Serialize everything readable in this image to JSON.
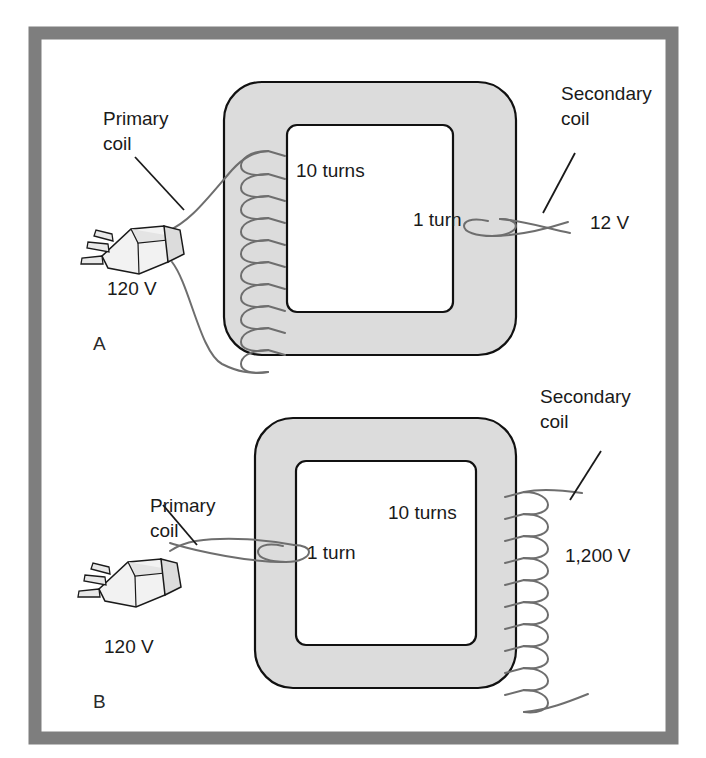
{
  "figure": {
    "frame_color": "#7e7e7e",
    "background_color": "#ffffff",
    "core_fill": "#dcdcdc",
    "core_stroke": "#111111",
    "wire_color": "#6e6e6e",
    "leader_color": "#1a1a1a"
  },
  "panels": [
    {
      "id": "A",
      "panel_label": "A",
      "type": "step-down",
      "primary": {
        "label_line1": "Primary",
        "label_line2": "coil",
        "turns_label": "10 turns",
        "turns": 10,
        "voltage_label": "120 V",
        "source_icon": "power-plug-icon"
      },
      "secondary": {
        "label_line1": "Secondary",
        "label_line2": "coil",
        "turns_label": "1 turn",
        "turns": 1,
        "voltage_label": "12 V"
      }
    },
    {
      "id": "B",
      "panel_label": "B",
      "type": "step-up",
      "primary": {
        "label_line1": "Primary",
        "label_line2": "coil",
        "turns_label": "1 turn",
        "turns": 1,
        "voltage_label": "120 V",
        "source_icon": "power-plug-icon"
      },
      "secondary": {
        "label_line1": "Secondary",
        "label_line2": "coil",
        "turns_label": "10 turns",
        "turns": 10,
        "voltage_label": "1,200 V"
      }
    }
  ]
}
